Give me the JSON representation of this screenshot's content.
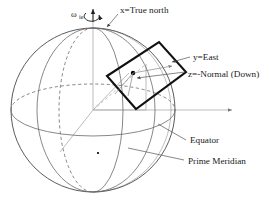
{
  "figure": {
    "background_color": "#ffffff",
    "width": 276,
    "height": 209
  },
  "labels": {
    "omega": "ω",
    "omega_subscript": "ie",
    "x_axis": "x=True north",
    "y_axis": "y=East",
    "z_axis": "z=-Normal (Down)",
    "equator": "Equator",
    "prime_meridian": "Prime Meridian"
  },
  "colors": {
    "sphere_outline": "#4a4a4a",
    "grid_line": "#6a6a6a",
    "ecef_axis": "#b0b0b0",
    "tangent_plane_edge": "#111111",
    "leader_line": "#555555",
    "text": "#1a1a1a"
  },
  "geometry": {
    "sphere_center_x": 93,
    "sphere_center_y": 110,
    "sphere_radius": 82,
    "north_pole_x": 93,
    "north_pole_y": 28,
    "tangent_point_x": 132,
    "tangent_point_y": 69
  }
}
